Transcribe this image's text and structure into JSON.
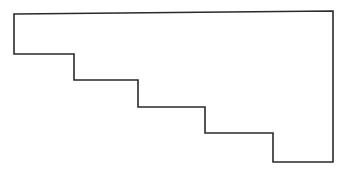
{
  "diagram": {
    "type": "hand-drawn staircase polygon outline",
    "canvas": {
      "width": 350,
      "height": 172,
      "background": "#ffffff"
    },
    "stroke": {
      "color": "#2a2a2a",
      "width": 1.6
    },
    "vertices": [
      [
        14,
        14
      ],
      [
        333,
        11
      ],
      [
        333,
        162
      ],
      [
        273,
        162
      ],
      [
        273,
        133
      ],
      [
        205,
        133
      ],
      [
        205,
        107
      ],
      [
        138,
        107
      ],
      [
        138,
        80
      ],
      [
        74,
        80
      ],
      [
        74,
        54
      ],
      [
        14,
        54
      ]
    ],
    "steps": 4,
    "labels": []
  }
}
